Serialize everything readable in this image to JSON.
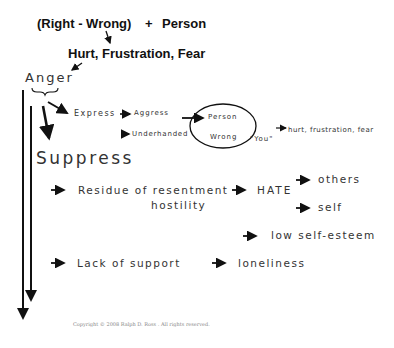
{
  "diagram": {
    "formula": {
      "left": "(Right - Wrong)",
      "plus": "+",
      "right": "Person"
    },
    "result": "Hurt, Frustration, Fear",
    "root": "Anger",
    "express": {
      "label": "Express",
      "aggress": "Aggress",
      "underhanded": "Underhanded",
      "circle_top": "Person",
      "circle_bottom": "Wrong",
      "you": "\"You\"",
      "outcome": "hurt, frustration, fear"
    },
    "suppress": {
      "label": "Suppress",
      "residue_line1": "Residue of resentment",
      "residue_line2": "hostility",
      "hate": "HATE",
      "others": "others",
      "self": "self",
      "low_self_esteem": "low self-esteem",
      "lack_of_support": "Lack of support",
      "loneliness": "loneliness"
    },
    "copyright": "Copyright © 2008 Ralph D. Ross . All rights reserved."
  }
}
